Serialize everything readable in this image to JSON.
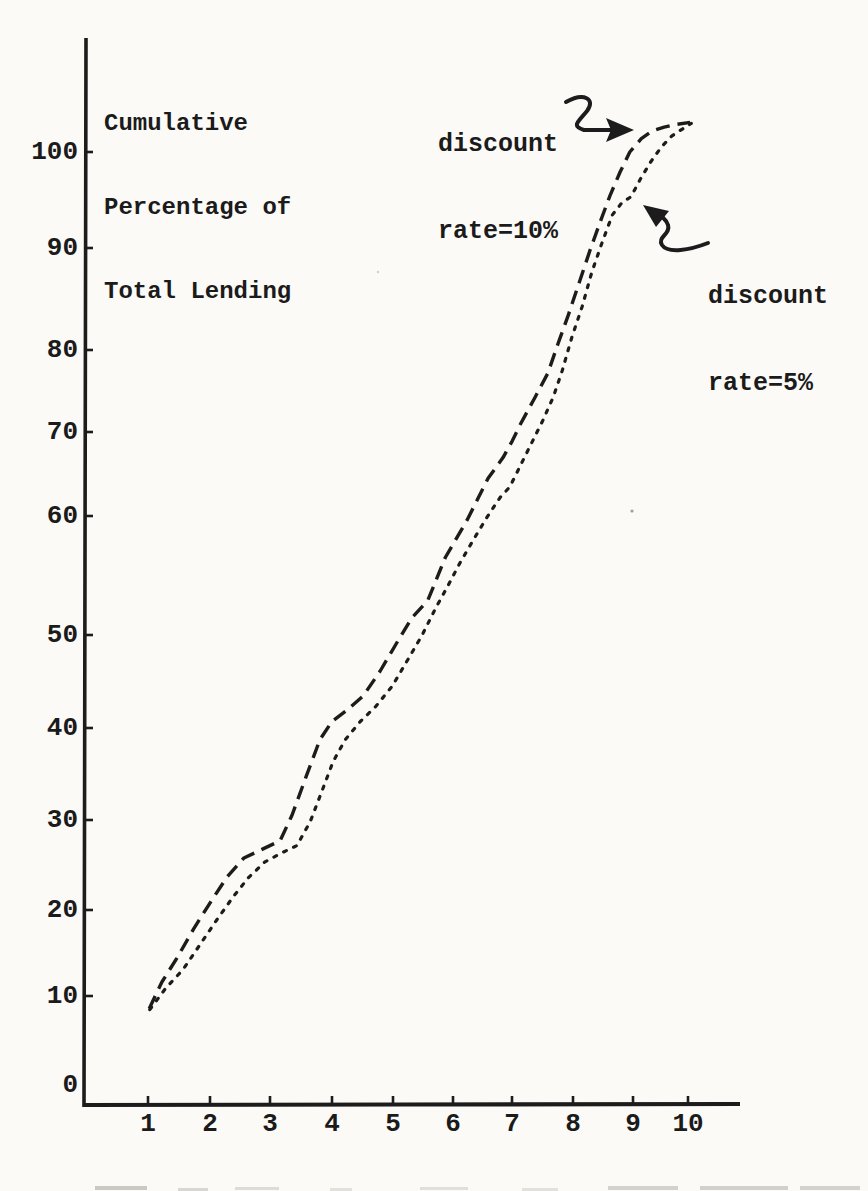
{
  "title_lines": [
    "Cumulative",
    "Percentage of",
    "Total Lending"
  ],
  "annotations": {
    "series_10": {
      "line1": "discount",
      "line2": "rate=10%"
    },
    "series_5": {
      "line1": "discount",
      "line2": "rate=5%"
    }
  },
  "axes": {
    "y_ticks": [
      "100",
      "90",
      "80",
      "70",
      "60",
      "50",
      "40",
      "30",
      "20",
      "10",
      "0"
    ],
    "x_ticks": [
      "1",
      "2",
      "3",
      "4",
      "5",
      "6",
      "7",
      "8",
      "9",
      "10"
    ]
  },
  "chart_data": {
    "type": "line",
    "title": "Cumulative Percentage of Total Lending",
    "ylabel": "Cumulative Percentage of Total Lending",
    "xlabel": "",
    "xlim": [
      0,
      11
    ],
    "ylim": [
      0,
      110
    ],
    "grid": false,
    "legend_position": "annotated-arrows",
    "style_note": "hand-drawn typewriter scan, black ink on paper",
    "ink_color": "#1c1c1c",
    "paper_color": "#fbfaf7",
    "x": [
      1,
      2,
      3,
      4,
      5,
      6,
      7,
      8,
      9,
      10
    ],
    "series": [
      {
        "id": "10pct",
        "name": "discount rate=10%",
        "line_style": "dashed",
        "values": [
          10,
          21,
          27,
          40,
          48,
          58,
          70,
          83,
          100,
          103
        ],
        "samples": [
          [
            1.02,
            10.2
          ],
          [
            1.23,
            13.0
          ],
          [
            1.48,
            15.5
          ],
          [
            1.76,
            18.6
          ],
          [
            2.03,
            21.3
          ],
          [
            2.31,
            24.0
          ],
          [
            2.59,
            26.0
          ],
          [
            2.89,
            26.9
          ],
          [
            3.19,
            27.8
          ],
          [
            3.39,
            30.5
          ],
          [
            3.62,
            34.5
          ],
          [
            3.85,
            38.4
          ],
          [
            4.05,
            40.3
          ],
          [
            4.32,
            41.6
          ],
          [
            4.57,
            43.0
          ],
          [
            4.85,
            45.6
          ],
          [
            5.15,
            48.8
          ],
          [
            5.38,
            51.2
          ],
          [
            5.64,
            53.0
          ],
          [
            5.93,
            57.5
          ],
          [
            6.29,
            61.4
          ],
          [
            6.64,
            65.8
          ],
          [
            6.89,
            68.0
          ],
          [
            7.04,
            69.7
          ],
          [
            7.17,
            71.4
          ],
          [
            7.42,
            74.3
          ],
          [
            7.63,
            76.8
          ],
          [
            7.8,
            79.9
          ],
          [
            7.97,
            82.9
          ],
          [
            8.13,
            85.9
          ],
          [
            8.33,
            89.7
          ],
          [
            8.5,
            92.7
          ],
          [
            8.66,
            95.4
          ],
          [
            8.83,
            97.9
          ],
          [
            8.99,
            100.0
          ],
          [
            9.18,
            101.4
          ],
          [
            9.36,
            102.2
          ],
          [
            9.56,
            102.6
          ],
          [
            9.77,
            102.9
          ],
          [
            9.99,
            103.1
          ]
        ]
      },
      {
        "id": "5pct",
        "name": "discount rate=5%",
        "line_style": "dotted",
        "values": [
          10,
          18,
          26,
          36,
          44,
          55,
          65,
          80,
          95,
          103
        ],
        "samples": [
          [
            1.03,
            10.1
          ],
          [
            1.3,
            12.4
          ],
          [
            1.58,
            14.3
          ],
          [
            1.86,
            16.9
          ],
          [
            2.14,
            19.5
          ],
          [
            2.41,
            21.9
          ],
          [
            2.66,
            23.9
          ],
          [
            2.94,
            25.6
          ],
          [
            3.24,
            26.6
          ],
          [
            3.47,
            27.3
          ],
          [
            3.69,
            29.8
          ],
          [
            3.89,
            33.1
          ],
          [
            4.07,
            36.1
          ],
          [
            4.27,
            38.4
          ],
          [
            4.52,
            40.3
          ],
          [
            4.78,
            41.9
          ],
          [
            5.05,
            44.0
          ],
          [
            5.31,
            46.8
          ],
          [
            5.54,
            49.3
          ],
          [
            5.78,
            52.3
          ],
          [
            5.98,
            54.6
          ],
          [
            6.17,
            56.9
          ],
          [
            6.41,
            59.5
          ],
          [
            6.62,
            61.7
          ],
          [
            6.84,
            63.8
          ],
          [
            7.0,
            64.9
          ],
          [
            7.33,
            69.1
          ],
          [
            7.55,
            71.9
          ],
          [
            7.72,
            74.3
          ],
          [
            7.87,
            77.1
          ],
          [
            8.03,
            80.6
          ],
          [
            8.2,
            83.8
          ],
          [
            8.36,
            87.4
          ],
          [
            8.53,
            90.5
          ],
          [
            8.7,
            93.4
          ],
          [
            8.86,
            94.7
          ],
          [
            9.01,
            95.3
          ],
          [
            9.16,
            97.1
          ],
          [
            9.33,
            98.9
          ],
          [
            9.51,
            100.5
          ],
          [
            9.69,
            101.7
          ],
          [
            9.86,
            102.4
          ],
          [
            10.01,
            103.0
          ]
        ]
      }
    ]
  }
}
